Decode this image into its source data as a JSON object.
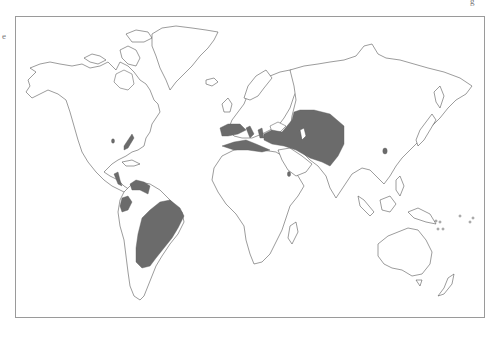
{
  "map": {
    "type": "world-distribution-map",
    "projection": "world outline",
    "colors": {
      "background": "#ffffff",
      "land_fill": "#ffffff",
      "coastline": "#4a4a4a",
      "shaded_region": "#6b6b6b",
      "frame": "#9a9a9a"
    },
    "edge_marks": {
      "left": "e",
      "top_right": "g"
    },
    "shaded_regions": [
      "Eastern United States (Atlantic coast)",
      "Southern Plains (small spot)",
      "Central America",
      "Venezuela / northern South America",
      "Ecuador / Colombia (west)",
      "Brazil / eastern South America",
      "Iberian Peninsula / Western Mediterranean",
      "North Africa coast",
      "Italy / Balkans",
      "Anatolia / Black Sea region",
      "Central Asia / Iran / Afghanistan",
      "Yemen (small spot)",
      "Eastern China (small spot)"
    ]
  }
}
